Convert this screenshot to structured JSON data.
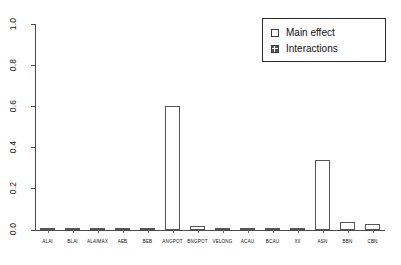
{
  "chart_data": {
    "type": "bar",
    "title": "",
    "xlabel": "",
    "ylabel": "",
    "ylim": [
      0.0,
      1.0
    ],
    "grid": false,
    "legend_position": "top-right",
    "categories": [
      "ALAI",
      "BLAI",
      "ALAIMAX",
      "AEB",
      "BEB",
      "ANGPOT",
      "BNGPOT",
      "VELONG",
      "ACAU",
      "BCAU",
      "XII",
      "ASN",
      "BBN",
      "CBN"
    ],
    "series": [
      {
        "name": "Main effect",
        "values": [
          0.002,
          0.002,
          0.002,
          0.003,
          0.006,
          0.601,
          0.021,
          0.004,
          0.002,
          0.002,
          0.002,
          0.341,
          0.04,
          0.03
        ]
      },
      {
        "name": "Interactions",
        "values": [
          0.0,
          0.0,
          0.0,
          0.0,
          0.0,
          0.0,
          0.0,
          0.0,
          0.0,
          0.0,
          0.0,
          0.0,
          0.0,
          0.0
        ]
      }
    ],
    "y_ticks": [
      {
        "value": 0.0,
        "label": "0.0"
      },
      {
        "value": 0.2,
        "label": "0.2"
      },
      {
        "value": 0.4,
        "label": "0.4"
      },
      {
        "value": 0.6,
        "label": "0.6"
      },
      {
        "value": 0.8,
        "label": "0.8"
      },
      {
        "value": 1.0,
        "label": "1.0"
      }
    ]
  },
  "legend": {
    "entries": [
      {
        "label": "Main effect",
        "style": "main",
        "color": "#ffffff"
      },
      {
        "label": "Interactions",
        "style": "inter",
        "color": "#4d4d4d"
      }
    ]
  },
  "colors": {
    "axis": "#4a4a4a",
    "bar_border": "#555555",
    "bar_main_fill": "#ffffff",
    "bar_interactions_fill": "#4d4d4d",
    "background": "#ffffff"
  }
}
